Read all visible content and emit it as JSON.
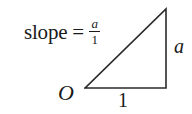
{
  "figure": {
    "kind": "slope-right-triangle-diagram",
    "background_color": "#ffffff",
    "ink_color": "#1a1a1a",
    "width": 192,
    "height": 114
  },
  "equation": {
    "word": "slope",
    "equals": "=",
    "fraction_numerator": "a",
    "fraction_denominator": "1"
  },
  "labels": {
    "origin": "O",
    "vertical_leg": "a",
    "horizontal_leg": "1"
  },
  "triangle": {
    "stroke_color": "#2b2b2b",
    "stroke_width": 1.6,
    "vertices": {
      "origin": [
        85,
        88
      ],
      "apex": [
        166,
        9
      ],
      "corner": [
        166,
        88
      ]
    },
    "points_path": "85,88 166,9 166,88"
  }
}
